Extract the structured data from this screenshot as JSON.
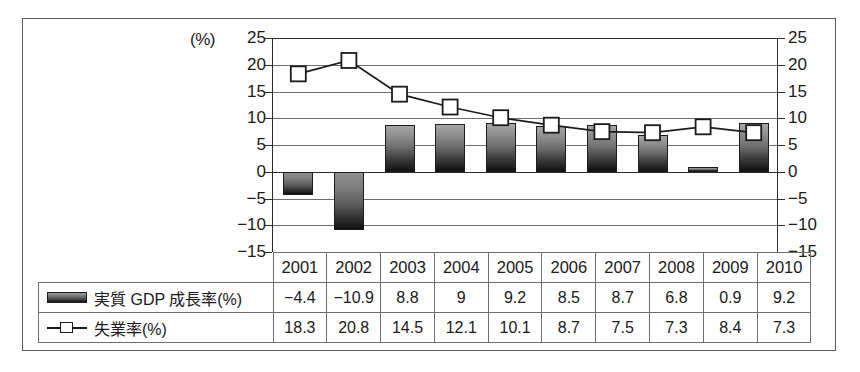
{
  "chart_data": {
    "type": "bar",
    "title": "",
    "subtitle": "",
    "xlabel": "",
    "ylabel": "",
    "unit_label": "(%)",
    "categories": [
      "2001",
      "2002",
      "2003",
      "2004",
      "2005",
      "2006",
      "2007",
      "2008",
      "2009",
      "2010"
    ],
    "ylim": [
      -15,
      25
    ],
    "y_ticks": [
      "25",
      "20",
      "15",
      "10",
      "5",
      "0",
      "-5",
      "-10",
      "-15"
    ],
    "y_tick_values": [
      25,
      20,
      15,
      10,
      5,
      0,
      -5,
      -10,
      -15
    ],
    "y_ticks_right": [
      "25",
      "20",
      "15",
      "10",
      "5",
      "0",
      "-5",
      "-10",
      "-15"
    ],
    "grid": true,
    "legend_position": "table-below",
    "series": [
      {
        "name": "実質 GDP 成長率(%)",
        "type": "bar",
        "marker": "bar-swatch",
        "values": [
          -4.4,
          -10.9,
          8.8,
          9,
          9.2,
          8.5,
          8.7,
          6.8,
          0.9,
          9.2
        ],
        "labels": [
          "-4.4",
          "-10.9",
          "8.8",
          "9",
          "9.2",
          "8.5",
          "8.7",
          "6.8",
          "0.9",
          "9.2"
        ]
      },
      {
        "name": "失業率(%)",
        "type": "line",
        "marker": "open-square",
        "values": [
          18.3,
          20.8,
          14.5,
          12.1,
          10.1,
          8.7,
          7.5,
          7.3,
          8.4,
          7.3
        ],
        "labels": [
          "18.3",
          "20.8",
          "14.5",
          "12.1",
          "10.1",
          "8.7",
          "7.5",
          "7.3",
          "8.4",
          "7.3"
        ]
      }
    ],
    "colors": {
      "bar_top": "#a7a7a7",
      "bar_bottom": "#121212",
      "line": "#1b1b1b",
      "marker_fill": "#ffffff",
      "gridline": "#6e6e6e",
      "axis": "#2b2b2b",
      "frame": "#5a5a5a",
      "table_border": "#6f6f6f",
      "text": "#1a1a1a"
    }
  },
  "table": {
    "year_header": [
      "2001",
      "2002",
      "2003",
      "2004",
      "2005",
      "2006",
      "2007",
      "2008",
      "2009",
      "2010"
    ],
    "rows": [
      {
        "label": "実質 GDP 成長率(%)",
        "swatch": "bar-swatch-icon",
        "values": [
          "-4.4",
          "-10.9",
          "8.8",
          "9",
          "9.2",
          "8.5",
          "8.7",
          "6.8",
          "0.9",
          "9.2"
        ]
      },
      {
        "label": "失業率(%)",
        "swatch": "line-square-swatch-icon",
        "values": [
          "18.3",
          "20.8",
          "14.5",
          "12.1",
          "10.1",
          "8.7",
          "7.5",
          "7.3",
          "8.4",
          "7.3"
        ]
      }
    ]
  }
}
